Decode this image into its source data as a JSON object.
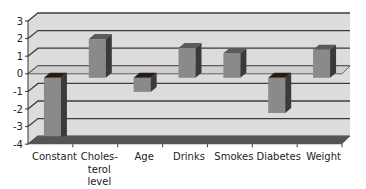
{
  "chart_data": {
    "type": "bar",
    "style": "3d-column",
    "title": "",
    "xlabel": "",
    "ylabel": "",
    "categories": [
      "Constant",
      "Choles-terol level",
      "Age",
      "Drinks",
      "Smokes",
      "Diabetes",
      "Weight"
    ],
    "category_lines": [
      [
        "Constant"
      ],
      [
        "Choles-",
        "terol",
        "level"
      ],
      [
        "Age"
      ],
      [
        "Drinks"
      ],
      [
        "Smokes"
      ],
      [
        "Diabetes"
      ],
      [
        "Weight"
      ]
    ],
    "values": [
      -3.6,
      2.2,
      -0.8,
      1.7,
      1.4,
      -2.0,
      1.6
    ],
    "ylim": [
      -4,
      3
    ],
    "yticks": [
      3,
      2,
      1,
      0,
      -1,
      -2,
      -3,
      -4
    ],
    "ytick_labels": [
      "3",
      "2",
      "1",
      "0",
      "-1",
      "-2",
      "-3",
      "-4"
    ],
    "grid": true,
    "legend": null,
    "colors": {
      "bar_front": "#8a8a8a",
      "bar_side": "#3a3a3a",
      "bar_top": "#5a5a5a",
      "wall": "#dcdcdc",
      "gridline": "#3c3c3c",
      "floor": "#555555"
    }
  }
}
